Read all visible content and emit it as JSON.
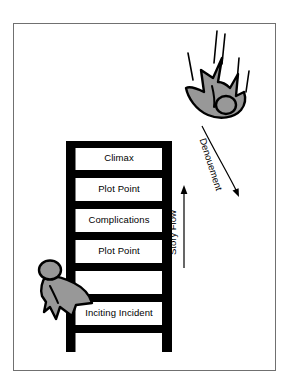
{
  "diagram": {
    "frame": {
      "border_color": "#707070",
      "background": "#ffffff"
    },
    "palette": {
      "ink": "#000000",
      "figure_fill": "#989898",
      "figure_outline": "#000000",
      "rung_fill": "#ffffff",
      "frame_border": "#707070"
    },
    "ladder": {
      "name": "story-structure-ladder",
      "rungs": [
        {
          "id": "climax",
          "label": "Climax"
        },
        {
          "id": "plot-point-upper",
          "label": "Plot Point"
        },
        {
          "id": "complications",
          "label": "Complications"
        },
        {
          "id": "plot-point-lower",
          "label": "Plot Point"
        },
        {
          "id": "inciting-incident",
          "label": "Inciting Incident"
        }
      ]
    },
    "annotations": {
      "story_flow": {
        "label": "Story Flow",
        "direction": "up",
        "arrow": "upward-arrow"
      },
      "denouement": {
        "label": "Denouement",
        "direction": "down-right",
        "arrow": "curved-descending-arrow"
      }
    },
    "figures": [
      {
        "id": "climbing-figure",
        "description": "Figure climbing the ladder at the inciting incident",
        "position": "bottom-left"
      },
      {
        "id": "falling-figure",
        "description": "Figure falling upside down after the climax",
        "position": "top-right",
        "motion_lines": 5
      }
    ]
  }
}
